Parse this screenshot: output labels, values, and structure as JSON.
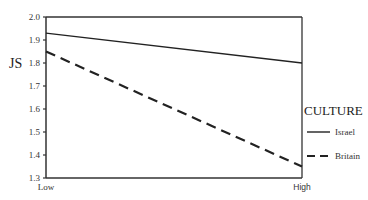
{
  "chart_data": {
    "type": "line",
    "title": "",
    "xlabel": "",
    "ylabel": "JS",
    "categories": [
      "Low",
      "High"
    ],
    "series": [
      {
        "name": "Israel",
        "style": "solid",
        "values": [
          1.93,
          1.8
        ]
      },
      {
        "name": "Britain",
        "style": "dashed",
        "values": [
          1.85,
          1.35
        ]
      }
    ],
    "ylim": [
      1.3,
      2.0
    ],
    "yticks": [
      "2.0",
      "1.9",
      "1.8",
      "1.7",
      "1.6",
      "1.5",
      "1.4",
      "1.3"
    ],
    "grid": false,
    "legend": {
      "title": "CULTURE",
      "position": "right",
      "entries": [
        "Israel",
        "Britain"
      ]
    },
    "colors": {
      "line": "#222222",
      "axis": "#333333",
      "background": "#ffffff"
    }
  }
}
